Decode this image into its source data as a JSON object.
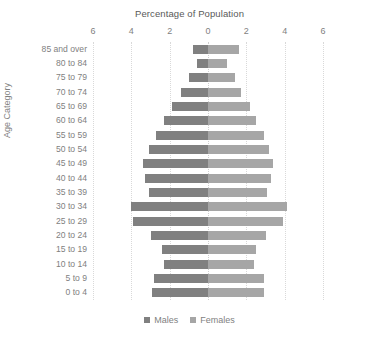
{
  "chart_data": {
    "type": "bar",
    "subtype": "population-pyramid",
    "title": "Percentage of Population",
    "xlabel": "Percentage of Population",
    "ylabel": "Age Category",
    "orientation": "horizontal",
    "grid": true,
    "legend_position": "bottom",
    "xlim": [
      -6,
      6
    ],
    "xticks": [
      6,
      4,
      2,
      0,
      2,
      4,
      6
    ],
    "xtick_values": [
      -6,
      -4,
      -2,
      0,
      2,
      4,
      6
    ],
    "categories": [
      "85 and over",
      "80 to 84",
      "75 to 79",
      "70 to 74",
      "65 to 69",
      "60 to 64",
      "55 to 59",
      "50 to 54",
      "45 to 49",
      "40 to 44",
      "35 to 39",
      "30 to 34",
      "25 to 29",
      "20 to 24",
      "15 to 19",
      "10 to 14",
      "5 to 9",
      "0 to 4"
    ],
    "series": [
      {
        "name": "Males",
        "color": "#808080",
        "side": "left",
        "values": [
          0.8,
          0.6,
          1.0,
          1.4,
          1.9,
          2.3,
          2.7,
          3.1,
          3.4,
          3.3,
          3.1,
          4.0,
          3.9,
          3.0,
          2.4,
          2.3,
          2.8,
          2.9
        ]
      },
      {
        "name": "Females",
        "color": "#a6a6a6",
        "side": "right",
        "values": [
          1.6,
          1.0,
          1.4,
          1.7,
          2.2,
          2.5,
          2.9,
          3.2,
          3.4,
          3.3,
          3.1,
          4.1,
          3.9,
          3.0,
          2.5,
          2.4,
          2.9,
          2.9
        ]
      }
    ]
  },
  "legend": {
    "items": [
      {
        "label": "Males",
        "color": "#808080"
      },
      {
        "label": "Females",
        "color": "#a6a6a6"
      }
    ]
  },
  "colors": {
    "background": "#ffffff",
    "gridline": "#d9d9d9",
    "text": "#7f7f7f",
    "title": "#595959",
    "male": "#808080",
    "female": "#a6a6a6"
  }
}
